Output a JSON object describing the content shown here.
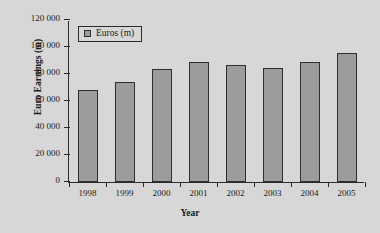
{
  "chart_data": {
    "type": "bar",
    "title": "",
    "xlabel": "Year",
    "ylabel": "Euro Earnings (m)",
    "categories": [
      "1998",
      "1999",
      "2000",
      "2001",
      "2002",
      "2003",
      "2004",
      "2005"
    ],
    "values": [
      68000,
      74000,
      83500,
      89000,
      87000,
      84500,
      89000,
      95500
    ],
    "series": [
      {
        "name": "Euros (m)",
        "values": [
          68000,
          74000,
          83500,
          89000,
          87000,
          84500,
          89000,
          95500
        ]
      }
    ],
    "ylim": [
      0,
      120000
    ],
    "yticks": [
      0,
      20000,
      40000,
      60000,
      80000,
      100000,
      120000
    ],
    "ytick_labels": [
      "0",
      "20 000",
      "40 000",
      "60 000",
      "80 000",
      "100 000",
      "120 000"
    ],
    "grid": false,
    "legend": {
      "position": "top-left-inside",
      "entries": [
        {
          "label": "Euros (m)",
          "swatch_name": "legend-swatch-euros",
          "color": "#9c9c9c"
        }
      ]
    },
    "colors": {
      "background": "#d7d7d7",
      "bar_fill": "#9c9c9c",
      "bar_edge": "#2e2e2e",
      "axis": "#2b2b2b",
      "text": "#1a1a1a"
    }
  }
}
